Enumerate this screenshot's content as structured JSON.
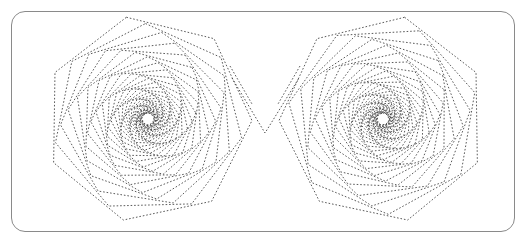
{
  "figure": {
    "kind": "geometric-line-drawing",
    "background_color": "#ffffff",
    "stroke_color": "#3c3c3c",
    "frame": {
      "name": "rounded-rectangle-border",
      "x": 11,
      "y": 11,
      "width": 504,
      "height": 221,
      "corner_radius": 14,
      "stroke_color": "#8a8a8a",
      "stroke_width": 1,
      "fill": "none"
    },
    "line_style": {
      "dash_pattern": "1.6 1.9",
      "stroke_width": 0.85,
      "linecap": "butt",
      "linejoin": "miter"
    },
    "spirals": [
      {
        "name": "left-spiral",
        "center_x": 148,
        "center_y": 119,
        "sides": 7,
        "iterations": 34,
        "start_radius": 104,
        "shrink_ratio": 0.918,
        "rotation_step_deg": 10.5,
        "start_rotation_deg": -12,
        "direction": 1
      },
      {
        "name": "right-spiral",
        "center_x": 383,
        "center_y": 119,
        "sides": 7,
        "iterations": 34,
        "start_radius": 104,
        "shrink_ratio": 0.918,
        "rotation_step_deg": 10.5,
        "start_rotation_deg": -12,
        "direction": -1
      }
    ],
    "connector": {
      "name": "center-v-connector",
      "points": "232,78 265,133 299,78",
      "description": "V-shaped pair of segments joining the inner edges of the two spirals"
    },
    "stray_segments": [
      {
        "name": "left-outer-tail",
        "x1": 230,
        "y1": 66,
        "x2": 252,
        "y2": 104
      },
      {
        "name": "right-outer-tail",
        "x1": 300,
        "y1": 66,
        "x2": 278,
        "y2": 104
      }
    ]
  }
}
